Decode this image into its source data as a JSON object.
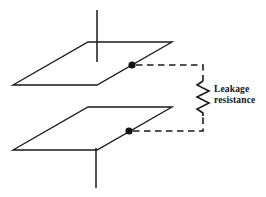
{
  "figure": {
    "type": "technical-line-diagram",
    "background_color": "#ffffff",
    "line_color": "#1a1a1a"
  },
  "labels": {
    "leakage_line1": "Leakage",
    "leakage_line2": "resistance"
  },
  "geometry": {
    "top_plate": {
      "name": "upper-capacitor-plate",
      "points": "13,85 88,42 172,42 97,85",
      "stroke_color": "#1a1a1a"
    },
    "bottom_plate": {
      "name": "lower-capacitor-plate",
      "points": "13,150 88,107 172,107 97,150",
      "stroke_color": "#1a1a1a"
    },
    "top_stem": {
      "name": "upper-plate-lead",
      "x": 97,
      "y1": 10,
      "y2": 62
    },
    "bottom_stem": {
      "name": "lower-plate-lead",
      "x": 96,
      "y1": 148,
      "y2": 188
    },
    "top_node": {
      "name": "upper-contact-node",
      "cx": 132,
      "cy": 65,
      "r": 3.6
    },
    "bottom_node": {
      "name": "lower-contact-node",
      "cx": 129,
      "cy": 131,
      "r": 3.6
    },
    "top_wire_path": "M136,65 L203,65 L203,81",
    "bottom_wire_path": "M133,131 L203,131 L203,116",
    "resistor_path": "M203,81 L197,85 L209,91 L197,97 L209,103 L197,109 L203,113 L203,116",
    "label_position": {
      "x": 214,
      "y1": 92,
      "y2": 103
    }
  }
}
